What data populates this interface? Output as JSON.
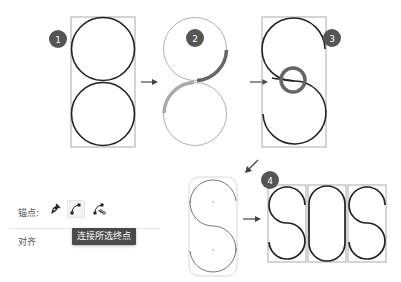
{
  "steps": [
    {
      "number": "1",
      "description": "two stacked circles in bounding box"
    },
    {
      "number": "2",
      "description": "circles with highlighted arc segments to keep"
    },
    {
      "number": "3",
      "description": "joined S path with highlighted junction"
    },
    {
      "number": "4",
      "description": "SOS letters built from paths"
    }
  ],
  "panel": {
    "anchor_label": "锚点:",
    "align_label": "对齐",
    "tools": [
      {
        "icon": "convert-anchor-pen-icon",
        "selected": false
      },
      {
        "icon": "connect-endpoints-icon",
        "selected": true
      },
      {
        "icon": "cut-path-at-anchor-icon",
        "selected": false
      }
    ],
    "tooltip": "连接所选终点"
  },
  "colors": {
    "stroke": "#222222",
    "highlight": "#6a6a6a",
    "highlight_light": "#aaaaaa",
    "frame": "#aaaaaa",
    "badge": "#555555"
  }
}
